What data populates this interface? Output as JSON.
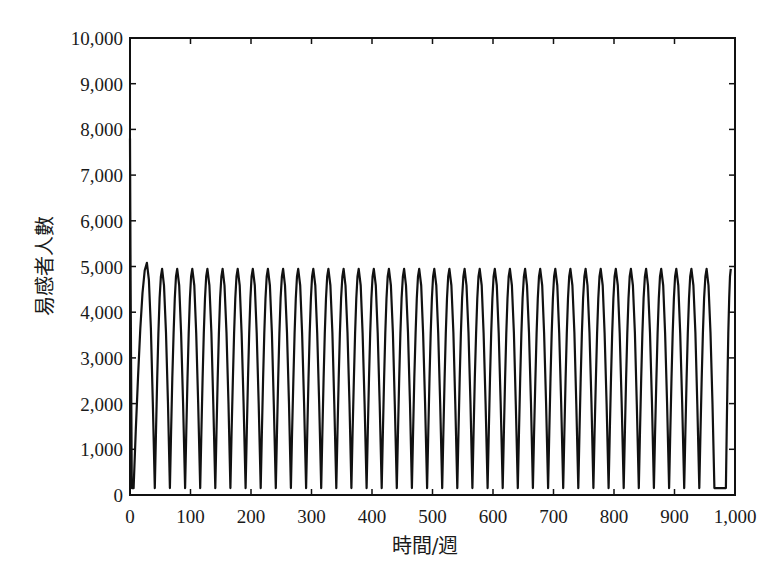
{
  "chart_data": {
    "type": "line",
    "title": "",
    "xlabel": "時間/週",
    "ylabel": "易感者人數",
    "xlim": [
      0,
      1000
    ],
    "ylim": [
      0,
      10000
    ],
    "grid": false,
    "legend": null,
    "x_ticks": [
      0,
      100,
      200,
      300,
      400,
      500,
      600,
      700,
      800,
      900,
      1000
    ],
    "x_tick_labels": [
      "0",
      "100",
      "200",
      "300",
      "400",
      "500",
      "600",
      "700",
      "800",
      "900",
      "1,000"
    ],
    "y_ticks": [
      0,
      1000,
      2000,
      3000,
      4000,
      5000,
      6000,
      7000,
      8000,
      9000,
      10000
    ],
    "y_tick_labels": [
      "0",
      "1,000",
      "2,000",
      "3,000",
      "4,000",
      "5,000",
      "6,000",
      "7,000",
      "8,000",
      "9,000",
      "10,000"
    ],
    "series": [
      {
        "name": "易感者人數",
        "color": "#111111",
        "description": "Initial spike to ~7,800 at t=0 dropping to near 0, then sustained sawtooth-like oscillation with period ~25 weeks; first peak ~5,080, later peaks ~4,950, troughs ~150.",
        "initial_value": 7800,
        "first_peak": {
          "x": 28,
          "y": 5080
        },
        "peak_value": 4950,
        "trough_value": 150,
        "period_weeks": 25,
        "num_peaks": 39,
        "peaks_x": [
          28,
          53,
          78,
          103,
          128,
          153,
          178,
          203,
          228,
          253,
          278,
          303,
          328,
          353,
          378,
          403,
          428,
          453,
          478,
          503,
          528,
          553,
          578,
          603,
          628,
          653,
          678,
          703,
          728,
          753,
          778,
          803,
          828,
          853,
          878,
          903,
          928,
          953,
          993
        ],
        "troughs_x": [
          6,
          41,
          66,
          91,
          116,
          141,
          166,
          191,
          216,
          241,
          266,
          291,
          316,
          341,
          366,
          391,
          416,
          441,
          466,
          491,
          516,
          541,
          566,
          591,
          616,
          641,
          666,
          691,
          716,
          741,
          766,
          791,
          816,
          841,
          866,
          891,
          916,
          941,
          966,
          985
        ]
      }
    ]
  }
}
